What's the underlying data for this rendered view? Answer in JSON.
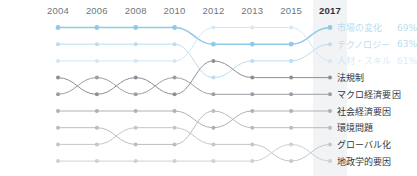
{
  "chart_data": {
    "type": "line",
    "subtype": "bump-rank-chart",
    "title": "",
    "xlabel": "",
    "ylabel": "",
    "grid": false,
    "legend_position": "right",
    "x": [
      "2004",
      "2006",
      "2008",
      "2010",
      "2012",
      "2013",
      "2015",
      "2017"
    ],
    "highlight_x": "2017",
    "ranks": [
      1,
      2,
      3,
      4,
      5,
      6,
      7,
      8,
      9
    ],
    "ylim": [
      1,
      9
    ],
    "series": [
      {
        "name": "市場の変化",
        "value_label": "69%",
        "color": "#8ec9ea",
        "emphasis": "high",
        "values": [
          1,
          1,
          1,
          1,
          2,
          2,
          2,
          1
        ]
      },
      {
        "name": "テクノロジー",
        "value_label": "63%",
        "color": "#bcdcf2",
        "emphasis": "medium",
        "values": [
          2,
          2,
          2,
          2,
          4,
          3,
          3,
          2
        ]
      },
      {
        "name": "人材・スキル",
        "value_label": "61%",
        "color": "#d3e7f5",
        "emphasis": "low",
        "values": [
          3,
          3,
          3,
          3,
          1,
          1,
          1,
          3
        ]
      },
      {
        "name": "法規制",
        "value_label": "",
        "color": "#8b9096",
        "emphasis": "gray",
        "values": [
          4,
          5,
          4,
          5,
          3,
          4,
          4,
          4
        ]
      },
      {
        "name": "マクロ経済要因",
        "value_label": "",
        "color": "#9a9fa5",
        "emphasis": "gray",
        "values": [
          5,
          4,
          5,
          4,
          5,
          5,
          5,
          5
        ]
      },
      {
        "name": "社会経済要因",
        "value_label": "",
        "color": "#adb2b8",
        "emphasis": "gray",
        "values": [
          6,
          6,
          6,
          6,
          7,
          6,
          6,
          6
        ]
      },
      {
        "name": "環境問題",
        "value_label": "",
        "color": "#b8bdc3",
        "emphasis": "gray",
        "values": [
          7,
          7,
          8,
          8,
          6,
          7,
          7,
          7
        ]
      },
      {
        "name": "グローバル化",
        "value_label": "",
        "color": "#c2c7cd",
        "emphasis": "gray",
        "values": [
          8,
          8,
          7,
          7,
          8,
          8,
          9,
          8
        ]
      },
      {
        "name": "地政学的要因",
        "value_label": "",
        "color": "#ccd1d7",
        "emphasis": "gray",
        "values": [
          9,
          9,
          9,
          9,
          9,
          9,
          8,
          9
        ]
      }
    ]
  },
  "axis": {
    "years": [
      {
        "label": "2004",
        "current": false
      },
      {
        "label": "2006",
        "current": false
      },
      {
        "label": "2008",
        "current": false
      },
      {
        "label": "2010",
        "current": false
      },
      {
        "label": "2012",
        "current": false
      },
      {
        "label": "2013",
        "current": false
      },
      {
        "label": "2015",
        "current": false
      },
      {
        "label": "2017",
        "current": true
      }
    ]
  },
  "colors": {
    "accent_blue": "#8ec9ea",
    "accent_blue_mid": "#bcdcf2",
    "accent_blue_light": "#d3e7f5",
    "gray_line": "#b0b5bb",
    "highlight_band": "#eceff1",
    "text_dark": "#2f353b",
    "text_muted": "#6e7780",
    "background": "#ffffff"
  }
}
